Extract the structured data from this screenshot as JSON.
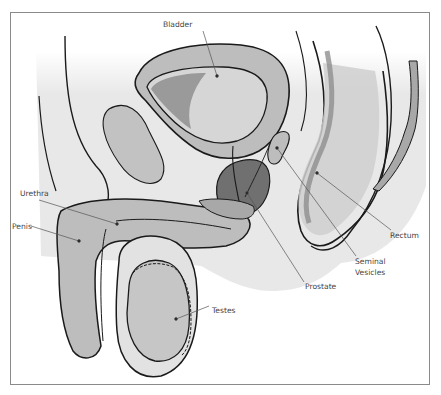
{
  "diagram": {
    "labels": [
      {
        "id": "bladder",
        "text": "Bladder"
      },
      {
        "id": "urethra",
        "text": "Urethra"
      },
      {
        "id": "penis",
        "text": "Penis"
      },
      {
        "id": "rectum",
        "text": "Rectum"
      },
      {
        "id": "seminal_vesicles_1",
        "text": "Seminal"
      },
      {
        "id": "seminal_vesicles_2",
        "text": "Vesicles"
      },
      {
        "id": "prostate",
        "text": "Prostate"
      },
      {
        "id": "testes",
        "text": "Testes"
      }
    ],
    "colors": {
      "outline": "#1a1a1a",
      "leader": "#555555",
      "tissue_light": "#e4e4e4",
      "tissue_mid": "#bdbdbd",
      "tissue_dark": "#8e8e8e",
      "prostate": "#6e6e6e",
      "frame": "#8a8a8a"
    }
  }
}
